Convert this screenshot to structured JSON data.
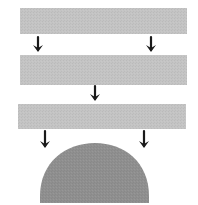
{
  "diagram": {
    "colors": {
      "background": "#ffffff",
      "layer_fill": "#c4c4c4",
      "dome_fill": "#8f8f8f",
      "arrow": "#1a1a1a"
    },
    "layers": [
      {
        "id": "layer-1",
        "label": ""
      },
      {
        "id": "layer-2",
        "label": ""
      },
      {
        "id": "layer-3",
        "label": ""
      }
    ],
    "arrow_groups": [
      {
        "between": [
          "layer-1",
          "layer-2"
        ],
        "count": 2
      },
      {
        "between": [
          "layer-2",
          "layer-3"
        ],
        "count": 1
      },
      {
        "between": [
          "layer-3",
          "dome"
        ],
        "count": 2
      }
    ],
    "dome": {
      "id": "dome",
      "label": ""
    }
  }
}
